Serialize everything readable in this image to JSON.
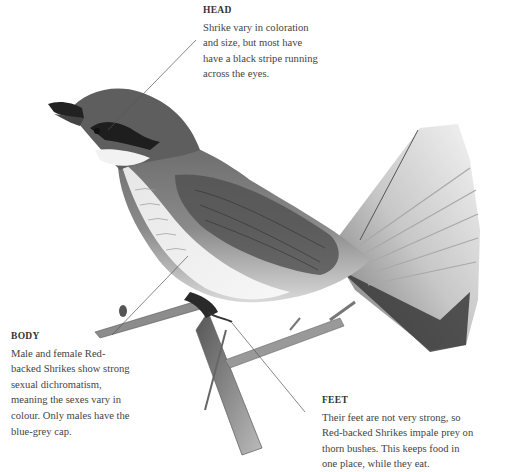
{
  "diagram": {
    "callouts": [
      {
        "id": "head",
        "title": "HEAD",
        "text": "Shrike vary in coloration\nand size, but most have\nhave a black stripe running\nacross the eyes."
      },
      {
        "id": "body",
        "title": "BODY",
        "text": "Male and female Red-\nbacked Shrikes show strong\nsexual dichromatism,\nmeaning the sexes vary in\ncolour. Only males have the\nblue-grey cap."
      },
      {
        "id": "feet",
        "title": "FEET",
        "text": "Their feet are not very strong, so\nRed-backed Shrikes impale prey on\nthorn bushes. This keeps food in\none place, while they eat."
      }
    ],
    "leader_lines": [
      {
        "to": "head",
        "x1": 196,
        "y1": 40,
        "x2": 108,
        "y2": 130
      },
      {
        "to": "body",
        "x1": 188,
        "y1": 256,
        "x2": 112,
        "y2": 335
      },
      {
        "to": "feet",
        "x1": 232,
        "y1": 323,
        "x2": 305,
        "y2": 412
      }
    ],
    "colors": {
      "background": "#ffffff",
      "text": "#444444",
      "line": "#555555",
      "bird_dark": "#3c3c3c",
      "bird_mid": "#7a7a7a",
      "bird_light": "#d8d8d8"
    }
  }
}
